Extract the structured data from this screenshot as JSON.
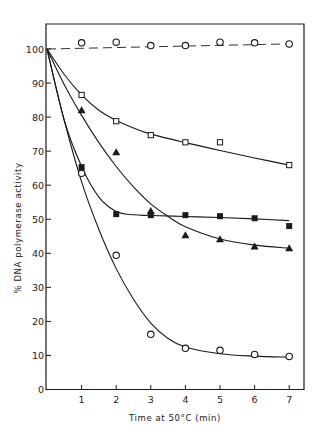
{
  "chart_data": {
    "type": "line",
    "title": "",
    "xlabel": "Time at 50°C (min)",
    "ylabel": "% DNA polymerase activity",
    "xlim": [
      0,
      7.4
    ],
    "ylim": [
      0,
      106
    ],
    "x_ticks": [
      1,
      2,
      3,
      4,
      5,
      6,
      7
    ],
    "y_ticks": [
      0,
      10,
      20,
      30,
      40,
      50,
      60,
      70,
      80,
      90,
      100
    ],
    "grid": false,
    "legend": null,
    "series": [
      {
        "name": "control (open circles, dashed)",
        "marker": "open-circle",
        "line": "dashed",
        "x": [
          0,
          1,
          2,
          3,
          4,
          5,
          6,
          7
        ],
        "values": [
          100,
          101.8,
          102,
          101,
          101,
          102,
          101.8,
          101.5
        ]
      },
      {
        "name": "open squares",
        "marker": "open-square",
        "line": "solid",
        "x": [
          0,
          1,
          2,
          3,
          4,
          5,
          7
        ],
        "values": [
          100,
          86.5,
          78.8,
          74.7,
          72.6,
          72.6,
          65.9
        ]
      },
      {
        "name": "filled triangles",
        "marker": "filled-triangle",
        "line": "solid",
        "x": [
          0,
          1,
          2,
          3,
          4,
          5,
          6,
          7
        ],
        "values": [
          100,
          82,
          69.7,
          52.4,
          45.3,
          44.1,
          42,
          41.5
        ]
      },
      {
        "name": "filled squares",
        "marker": "filled-square",
        "line": "solid",
        "x": [
          0,
          1,
          2,
          3,
          4,
          5,
          6,
          7
        ],
        "values": [
          100,
          65.3,
          51.5,
          51.2,
          51.2,
          50.9,
          50.3,
          48
        ]
      },
      {
        "name": "open circles",
        "marker": "open-circle",
        "line": "solid",
        "x": [
          0,
          1,
          2,
          3,
          4,
          5,
          6,
          7
        ],
        "values": [
          100,
          63.5,
          39.4,
          16.2,
          12.1,
          11.5,
          10.3,
          9.7
        ]
      }
    ],
    "fit_curves": [
      {
        "series": "control (open circles, dashed)",
        "x": [
          0,
          7
        ],
        "values": [
          100,
          101.5
        ]
      },
      {
        "series": "open squares",
        "x": [
          0,
          0.5,
          1,
          1.5,
          2,
          2.5,
          3,
          4,
          5,
          6,
          7
        ],
        "values": [
          100,
          92.5,
          86.5,
          82,
          79,
          76.8,
          75,
          72.5,
          70.2,
          68,
          65.9
        ]
      },
      {
        "series": "filled triangles",
        "x": [
          0,
          0.5,
          1,
          1.5,
          2,
          2.5,
          3,
          3.5,
          4,
          5,
          6,
          7
        ],
        "values": [
          100,
          89.5,
          80.5,
          72.5,
          65.5,
          59.5,
          54.5,
          50.8,
          47.8,
          44.2,
          42.4,
          41.5
        ]
      },
      {
        "series": "filled squares",
        "x": [
          0,
          0.5,
          1,
          1.5,
          2,
          2.5,
          3,
          4,
          5,
          6,
          7
        ],
        "values": [
          100,
          79,
          65.5,
          56.5,
          52.3,
          51.3,
          51.1,
          50.8,
          50.5,
          50.1,
          49.6
        ]
      },
      {
        "series": "open circles",
        "x": [
          0,
          0.5,
          1,
          1.5,
          2,
          2.5,
          3,
          3.5,
          4,
          5,
          6,
          7
        ],
        "values": [
          100,
          79,
          61,
          47,
          35.5,
          26.5,
          19.5,
          15,
          12.5,
          10.5,
          9.8,
          9.5
        ]
      }
    ]
  },
  "axes": {
    "x_tick_labels": [
      "1",
      "2",
      "3",
      "4",
      "5",
      "6",
      "7"
    ],
    "y_tick_labels": [
      "0",
      "10",
      "20",
      "30",
      "40",
      "50",
      "60",
      "70",
      "80",
      "90",
      "100"
    ],
    "x_title": "Time at 50°C (min)",
    "y_title": "% DNA polymerase activity"
  },
  "colors": {
    "ink": "#1a1a1a",
    "background": "#ffffff"
  }
}
